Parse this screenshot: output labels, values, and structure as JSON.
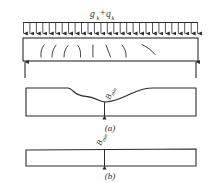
{
  "figure": {
    "domain_note": "structural engineering beam diagram",
    "background_color": "#ffffff",
    "line_color": "#2b2b2b",
    "top_panel": {
      "load_label": {
        "g": "g",
        "g_sub": "k",
        "plus": "+",
        "q": "q",
        "q_sub": "k"
      },
      "load_arrow_count": 28,
      "beam_name": "simply-supported-beam",
      "crack_marks_count": 8,
      "support_left_label": "",
      "support_right_label": ""
    },
    "middle_panel": {
      "caption": "(a)",
      "b_label": "B",
      "b_label_sub": "min",
      "shape_name": "variable-width-slab-plan-a"
    },
    "bottom_panel": {
      "caption": "(b)",
      "b_label": "B",
      "b_label_sub": "min",
      "shape_name": "constant-width-slab-plan-b"
    }
  }
}
